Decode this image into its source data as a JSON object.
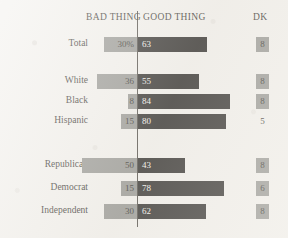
{
  "header": {
    "bad_thing": "BAD THING",
    "good_thing": "GOOD THING",
    "dk": "DK"
  },
  "chart_data": {
    "type": "bar",
    "subtype": "diverging-horizontal-stacked",
    "title": "",
    "xlabel": "",
    "ylabel": "",
    "legend_position": "top",
    "grid": false,
    "xlim": [
      0,
      100
    ],
    "categories": [
      "Total",
      "White",
      "Black",
      "Hispanic",
      "Republican",
      "Democrat",
      "Independent"
    ],
    "group_breaks_after": [
      "Total",
      "Hispanic"
    ],
    "series": [
      {
        "name": "BAD THING",
        "direction": "left",
        "color": "#8a8a86",
        "values": [
          30,
          36,
          8,
          15,
          50,
          15,
          30
        ],
        "labels": [
          "30%",
          "36",
          "8",
          "15",
          "50",
          "15",
          "30"
        ]
      },
      {
        "name": "GOOD THING",
        "direction": "right",
        "color": "#141210",
        "values": [
          63,
          55,
          84,
          80,
          43,
          78,
          62
        ],
        "labels": [
          "63",
          "55",
          "84",
          "80",
          "43",
          "78",
          "62"
        ]
      },
      {
        "name": "DK",
        "direction": "column",
        "color": "#8a8a86",
        "values": [
          8,
          8,
          8,
          5,
          8,
          6,
          8
        ],
        "labels": [
          "8",
          "8",
          "8",
          "5",
          "8",
          "6",
          "8"
        ],
        "boxed": [
          true,
          true,
          true,
          false,
          true,
          false,
          true
        ]
      }
    ],
    "rows": [
      {
        "label": "Total",
        "bad": 30,
        "bad_label": "30%",
        "good": 63,
        "good_label": "63",
        "dk": 8,
        "dk_label": "8",
        "dk_boxed": true,
        "y": 37
      },
      {
        "label": "White",
        "bad": 36,
        "bad_label": "36",
        "good": 55,
        "good_label": "55",
        "dk": 8,
        "dk_label": "8",
        "dk_boxed": true,
        "y": 74
      },
      {
        "label": "Black",
        "bad": 8,
        "bad_label": "8",
        "good": 84,
        "good_label": "84",
        "dk": 8,
        "dk_label": "8",
        "dk_boxed": true,
        "y": 94
      },
      {
        "label": "Hispanic",
        "bad": 15,
        "bad_label": "15",
        "good": 80,
        "good_label": "80",
        "dk": 5,
        "dk_label": "5",
        "dk_boxed": false,
        "y": 114
      },
      {
        "label": "Republican",
        "bad": 50,
        "bad_label": "50",
        "good": 43,
        "good_label": "43",
        "dk": 8,
        "dk_label": "8",
        "dk_boxed": true,
        "y": 158
      },
      {
        "label": "Democrat",
        "bad": 15,
        "bad_label": "15",
        "good": 78,
        "good_label": "78",
        "dk": 6,
        "dk_label": "6",
        "dk_boxed": true,
        "y": 181
      },
      {
        "label": "Independent",
        "bad": 30,
        "bad_label": "30",
        "good": 62,
        "good_label": "62",
        "dk": 8,
        "dk_label": "8",
        "dk_boxed": true,
        "y": 204
      }
    ]
  },
  "geometry": {
    "center_x": 137,
    "px_per_unit": 1.1,
    "dk_x": 256
  }
}
